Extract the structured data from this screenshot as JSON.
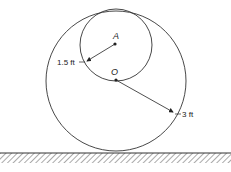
{
  "diagram": {
    "points": [
      {
        "id": "A",
        "label": "A"
      },
      {
        "id": "O",
        "label": "O"
      }
    ],
    "dimensions": {
      "small_radius": "1.5 ft",
      "large_radius": "3 ft"
    },
    "colors": {
      "stroke": "#333333",
      "background": "#ffffff"
    }
  }
}
